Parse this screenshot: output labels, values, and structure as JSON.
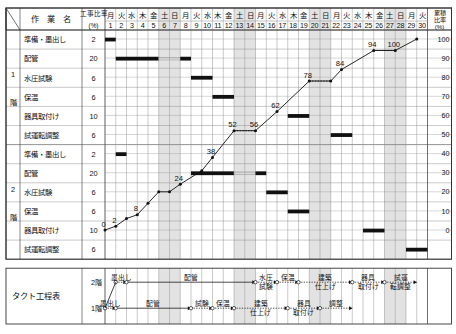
{
  "header": {
    "corner_label": "",
    "task_col_label": "作　業　名",
    "ratio_col_label": "工事比率",
    "ratio_col_unit": "(%)",
    "cumulative_label": "累積比率",
    "cumulative_unit": "(%)"
  },
  "calendar": {
    "weekdays": [
      "月",
      "火",
      "水",
      "木",
      "金",
      "土",
      "日",
      "月",
      "火",
      "水",
      "木",
      "金",
      "土",
      "日",
      "月",
      "火",
      "水",
      "木",
      "金",
      "土",
      "日",
      "月",
      "火",
      "水",
      "木",
      "金",
      "土",
      "日",
      "月",
      "火"
    ],
    "days": [
      1,
      2,
      3,
      4,
      5,
      6,
      7,
      8,
      9,
      10,
      11,
      12,
      13,
      14,
      15,
      16,
      17,
      18,
      19,
      20,
      21,
      22,
      23,
      24,
      25,
      26,
      27,
      28,
      29,
      30
    ],
    "holiday_days": [
      6,
      7,
      13,
      14,
      20,
      21,
      27,
      28
    ]
  },
  "floors": [
    {
      "label": "1階",
      "label_chars": [
        "1",
        "階"
      ]
    },
    {
      "label": "2階",
      "label_chars": [
        "2",
        "階"
      ]
    }
  ],
  "rows": [
    {
      "floor": "1階",
      "name": "準備・墨出し",
      "ratio": 2,
      "bar_start": 1,
      "bar_end": 1,
      "dotted": null
    },
    {
      "floor": "1階",
      "name": "配管",
      "ratio": 20,
      "bar_start": 2,
      "bar_end": 8,
      "dotted": [
        6,
        7
      ]
    },
    {
      "floor": "1階",
      "name": "水圧試験",
      "ratio": 6,
      "bar_start": 9,
      "bar_end": 10,
      "dotted": null
    },
    {
      "floor": "1階",
      "name": "保温",
      "ratio": 6,
      "bar_start": 11,
      "bar_end": 12,
      "dotted": null
    },
    {
      "floor": "1階",
      "name": "器具取付け",
      "ratio": 10,
      "bar_start": 18,
      "bar_end": 19,
      "dotted": null
    },
    {
      "floor": "1階",
      "name": "試運転調整",
      "ratio": 6,
      "bar_start": 22,
      "bar_end": 23,
      "dotted": null
    },
    {
      "floor": "2階",
      "name": "準備・墨出し",
      "ratio": 2,
      "bar_start": 2,
      "bar_end": 2,
      "dotted": null
    },
    {
      "floor": "2階",
      "name": "配管",
      "ratio": 20,
      "bar_start": 9,
      "bar_end": 15,
      "dotted": [
        13,
        14
      ]
    },
    {
      "floor": "2階",
      "name": "水圧試験",
      "ratio": 6,
      "bar_start": 16,
      "bar_end": 17,
      "dotted": null
    },
    {
      "floor": "2階",
      "name": "保温",
      "ratio": 6,
      "bar_start": 18,
      "bar_end": 19,
      "dotted": null
    },
    {
      "floor": "2階",
      "name": "器具取付け",
      "ratio": 10,
      "bar_start": 25,
      "bar_end": 26,
      "dotted": null
    },
    {
      "floor": "2階",
      "name": "試運転調整",
      "ratio": 6,
      "bar_start": 29,
      "bar_end": 30,
      "dotted": null
    }
  ],
  "chart_data": {
    "type": "line",
    "title": "",
    "xlabel": "",
    "ylabel": "累積比率(%)",
    "ylim": [
      0,
      100
    ],
    "yticks": [
      0,
      10,
      20,
      30,
      40,
      50,
      60,
      70,
      80,
      90,
      100
    ],
    "x": [
      1,
      2,
      3,
      4,
      5,
      6,
      7,
      8,
      9,
      10,
      11,
      12,
      13,
      14,
      15,
      16,
      17,
      18,
      19,
      20,
      21,
      22,
      23,
      24,
      25,
      26,
      27,
      28,
      29,
      30
    ],
    "series": [
      {
        "name": "累積比率",
        "points": [
          {
            "day": 1,
            "value": 0,
            "label": "0",
            "show_label": true
          },
          {
            "day": 2,
            "value": 2,
            "label": "2",
            "show_label": true
          },
          {
            "day": 3,
            "value": 6,
            "label": "6",
            "show_label": false
          },
          {
            "day": 4,
            "value": 8,
            "label": "8",
            "show_label": true
          },
          {
            "day": 5,
            "value": 14,
            "label": "",
            "show_label": false
          },
          {
            "day": 6,
            "value": 20,
            "label": "",
            "show_label": false
          },
          {
            "day": 7,
            "value": 20,
            "label": "",
            "show_label": false
          },
          {
            "day": 8,
            "value": 24,
            "label": "24",
            "show_label": true
          },
          {
            "day": 10,
            "value": 31,
            "label": "",
            "show_label": false
          },
          {
            "day": 11,
            "value": 38,
            "label": "38",
            "show_label": true
          },
          {
            "day": 13,
            "value": 52,
            "label": "52",
            "show_label": true
          },
          {
            "day": 15,
            "value": 52,
            "label": "56",
            "show_label": true
          },
          {
            "day": 17,
            "value": 62,
            "label": "62",
            "show_label": true
          },
          {
            "day": 20,
            "value": 78,
            "label": "78",
            "show_label": true
          },
          {
            "day": 22,
            "value": 78,
            "label": "",
            "show_label": false
          },
          {
            "day": 23,
            "value": 84,
            "label": "84",
            "show_label": true
          },
          {
            "day": 26,
            "value": 94,
            "label": "94",
            "show_label": true
          },
          {
            "day": 28,
            "value": 94,
            "label": "100",
            "show_label": true
          },
          {
            "day": 30,
            "value": 100,
            "label": "",
            "show_label": false
          }
        ]
      }
    ],
    "flat_segments": [
      {
        "from_day": 13,
        "to_day": 15,
        "value": 52
      },
      {
        "from_day": 20,
        "to_day": 22,
        "value": 78
      },
      {
        "from_day": 26,
        "to_day": 28,
        "value": 94
      }
    ],
    "legend": [],
    "grid": true
  },
  "takt": {
    "title": "タクト工程表",
    "rows": [
      {
        "floor_label": "2階",
        "activities": [
          {
            "label": "墨出し",
            "start_day": 2,
            "end_day": 3
          },
          {
            "label": "配管",
            "start_day": 3,
            "end_day": 15
          },
          {
            "label": "水圧試験",
            "start_day": 15,
            "end_day": 17
          },
          {
            "label": "保温",
            "start_day": 17,
            "end_day": 19
          },
          {
            "label": "建築仕上げ",
            "start_day": 19,
            "end_day": 24
          },
          {
            "label": "器具取付け",
            "start_day": 24,
            "end_day": 27
          },
          {
            "label": "試運転調整",
            "start_day": 27,
            "end_day": 30
          }
        ]
      },
      {
        "floor_label": "1階",
        "activities": [
          {
            "label": "墨出し",
            "start_day": 1,
            "end_day": 2
          },
          {
            "label": "配管",
            "start_day": 2,
            "end_day": 9
          },
          {
            "label": "試験",
            "start_day": 9,
            "end_day": 11
          },
          {
            "label": "保温",
            "start_day": 11,
            "end_day": 13
          },
          {
            "label": "建築仕上げ",
            "start_day": 13,
            "end_day": 18
          },
          {
            "label": "器具取付け",
            "start_day": 18,
            "end_day": 21
          },
          {
            "label": "調整",
            "start_day": 21,
            "end_day": 24
          }
        ]
      }
    ]
  },
  "colors": {
    "ink": "#111111",
    "grid": "#888888",
    "holiday": "#e2e2e2",
    "bar": "#111111",
    "border": "#333333"
  }
}
